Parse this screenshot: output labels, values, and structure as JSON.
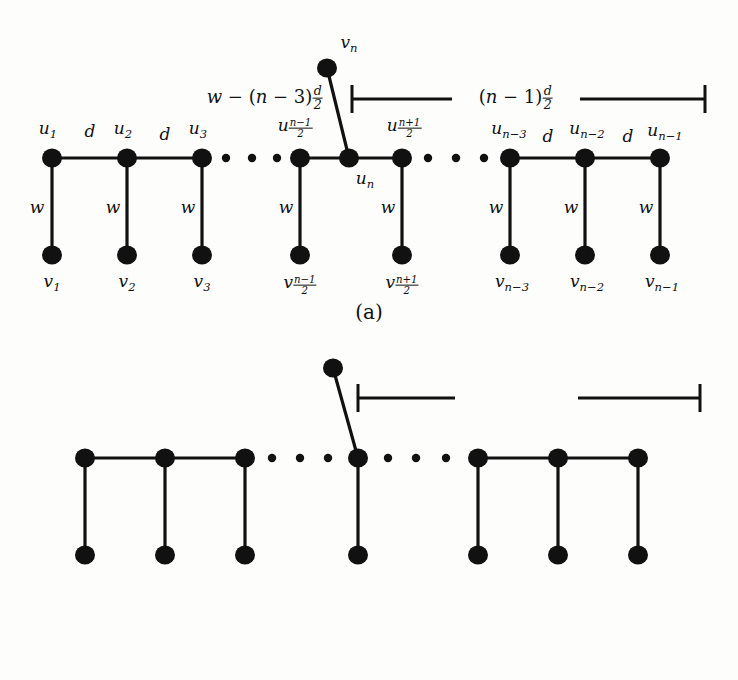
{
  "figure": {
    "type": "graph-diagram",
    "node_color": "#111111",
    "edge_color": "#111111",
    "background": "#fdfdfb"
  },
  "panels": [
    {
      "id": "a",
      "caption": "(a)",
      "top_nodes": [
        {
          "name": "u1",
          "label_parts": {
            "base": "u",
            "sub": "1"
          }
        },
        {
          "name": "u2",
          "label_parts": {
            "base": "u",
            "sub": "2"
          }
        },
        {
          "name": "u3",
          "label_parts": {
            "base": "u",
            "sub": "3"
          }
        },
        {
          "name": "u_nm1_2",
          "label_parts": {
            "base": "u",
            "sub_frac": {
              "num": "n − 1",
              "den": "2"
            }
          }
        },
        {
          "name": "un",
          "label_parts": {
            "base": "u",
            "sub": "n"
          }
        },
        {
          "name": "u_np1_2",
          "label_parts": {
            "base": "u",
            "sub_frac": {
              "num": "n + 1",
              "den": "2"
            }
          }
        },
        {
          "name": "un-3",
          "label_parts": {
            "base": "u",
            "sub": "n−3"
          }
        },
        {
          "name": "un-2",
          "label_parts": {
            "base": "u",
            "sub": "n−2"
          }
        },
        {
          "name": "un-1",
          "label_parts": {
            "base": "u",
            "sub": "n−1"
          }
        }
      ],
      "bottom_nodes": [
        {
          "name": "v1",
          "label_parts": {
            "base": "v",
            "sub": "1"
          }
        },
        {
          "name": "v2",
          "label_parts": {
            "base": "v",
            "sub": "2"
          }
        },
        {
          "name": "v3",
          "label_parts": {
            "base": "v",
            "sub": "3"
          }
        },
        {
          "name": "v_nm1_2",
          "label_parts": {
            "base": "v",
            "sub_frac": {
              "num": "n − 1",
              "den": "2"
            }
          }
        },
        {
          "name": "v_np1_2",
          "label_parts": {
            "base": "v",
            "sub_frac": {
              "num": "n + 1",
              "den": "2"
            }
          }
        },
        {
          "name": "vn-3",
          "label_parts": {
            "base": "v",
            "sub": "n−3"
          }
        },
        {
          "name": "vn-2",
          "label_parts": {
            "base": "v",
            "sub": "n−2"
          }
        },
        {
          "name": "vn-1",
          "label_parts": {
            "base": "v",
            "sub": "n−1"
          }
        }
      ],
      "apex_node": {
        "name": "vn",
        "label_parts": {
          "base": "v",
          "sub": "n"
        }
      },
      "horizontal_edge_labels": [
        "d",
        "d",
        "d",
        "d"
      ],
      "vertical_edge_labels": [
        "w",
        "w",
        "w",
        "w",
        "w",
        "w",
        "w",
        "w"
      ],
      "bracket_left_label": {
        "text": "w − (n − 3)",
        "frac": {
          "num": "d",
          "den": "2"
        }
      },
      "bracket_right_label": {
        "text": "(n − 1)",
        "frac": {
          "num": "d",
          "den": "2"
        }
      },
      "ellipsis_dots": 3
    },
    {
      "id": "b",
      "caption": "(b)",
      "top_nodes": [
        {
          "name": "u1",
          "label_parts": {
            "base": "u",
            "sub": "1"
          }
        },
        {
          "name": "u2",
          "label_parts": {
            "base": "u",
            "sub": "2"
          }
        },
        {
          "name": "u3",
          "label_parts": {
            "base": "u",
            "sub": "3"
          }
        },
        {
          "name": "un",
          "label_parts": {
            "base": "u",
            "sub": "n"
          }
        },
        {
          "name": "un-3",
          "label_parts": {
            "base": "u",
            "sub": "n−3"
          }
        },
        {
          "name": "un-2",
          "label_parts": {
            "base": "u",
            "sub": "n−2"
          }
        },
        {
          "name": "un-1",
          "label_parts": {
            "base": "u",
            "sub": "n−1"
          }
        }
      ],
      "bottom_nodes": [
        {
          "name": "v1",
          "label_parts": {
            "base": "v",
            "sub": "1"
          }
        },
        {
          "name": "v2",
          "label_parts": {
            "base": "v",
            "sub": "2"
          }
        },
        {
          "name": "v3",
          "label_parts": {
            "base": "v",
            "sub": "3"
          }
        },
        {
          "name": "v_n_2",
          "label_parts": {
            "base": "v",
            "sub_frac": {
              "num": "n",
              "den": "2"
            }
          }
        },
        {
          "name": "vn-3",
          "label_parts": {
            "base": "v",
            "sub": "n−3"
          }
        },
        {
          "name": "vn-2",
          "label_parts": {
            "base": "v",
            "sub": "n−2"
          }
        },
        {
          "name": "vn-1",
          "label_parts": {
            "base": "v",
            "sub": "n−1"
          }
        }
      ],
      "apex_node": {
        "name": "vn",
        "label_parts": {
          "base": "v",
          "sub": "n"
        }
      },
      "horizontal_edge_labels": [
        "d",
        "d",
        "d",
        "d"
      ],
      "vertical_edge_labels": [
        "w",
        "w",
        "w",
        "w",
        "w",
        "w",
        "w"
      ],
      "bracket_left_label": {
        "text": "w − (n − 3)",
        "frac": {
          "num": "d",
          "den": "2"
        }
      },
      "bracket_right_label": {
        "text": "(n − 1)",
        "frac": {
          "num": "d",
          "den": "2"
        }
      },
      "ellipsis_dots": 3
    }
  ],
  "glyphs": {
    "d": "d",
    "w": "w"
  }
}
